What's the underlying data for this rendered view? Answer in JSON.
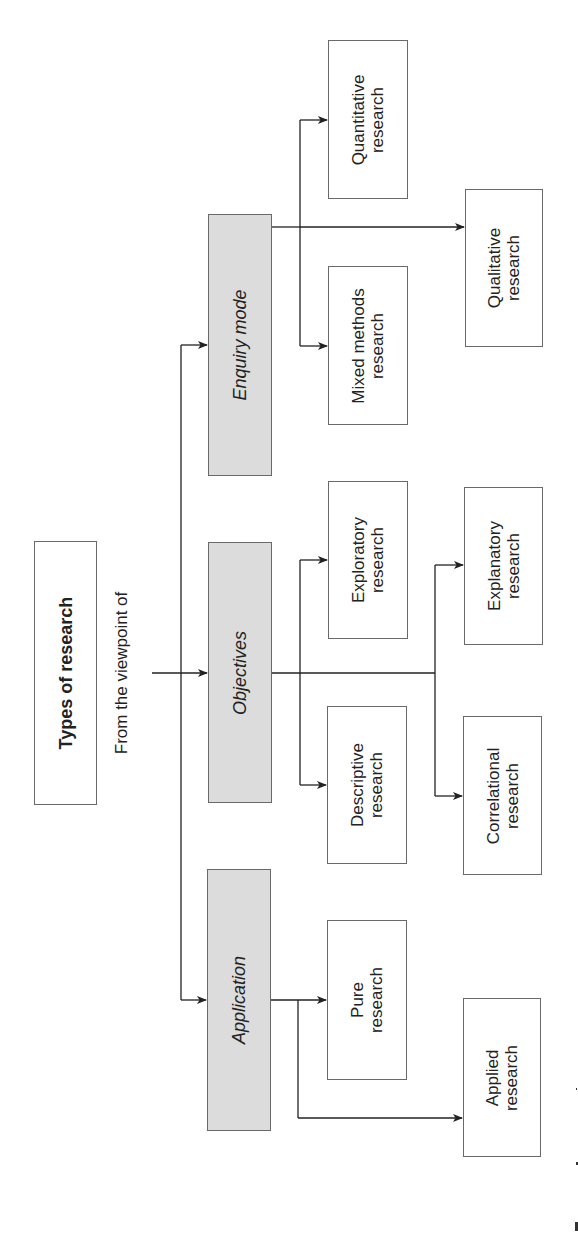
{
  "title": "Types of research",
  "connector_label": "From the viewpoint of",
  "categories": [
    {
      "id": "enquiry",
      "label": "Enquiry mode",
      "children": [
        {
          "label_line1": "Quantitative",
          "label_line2": "research"
        },
        {
          "label_line1": "Mixed methods",
          "label_line2": "research"
        },
        {
          "label_line1": "Qualitative",
          "label_line2": "research"
        }
      ]
    },
    {
      "id": "objectives",
      "label": "Objectives",
      "children": [
        {
          "label_line1": "Exploratory",
          "label_line2": "research"
        },
        {
          "label_line1": "Descriptive",
          "label_line2": "research"
        },
        {
          "label_line1": "Explanatory",
          "label_line2": "research"
        },
        {
          "label_line1": "Correlational",
          "label_line2": "research"
        }
      ]
    },
    {
      "id": "application",
      "label": "Application",
      "children": [
        {
          "label_line1": "Pure",
          "label_line2": "research"
        },
        {
          "label_line1": "Applied",
          "label_line2": "research"
        }
      ]
    }
  ],
  "colors": {
    "category_fill": "#dcdcdc",
    "leaf_fill": "#ffffff",
    "shadow": "#c8c8c8",
    "line": "#222222"
  }
}
